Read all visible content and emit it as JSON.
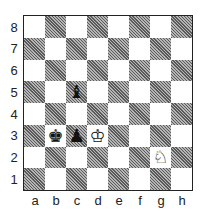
{
  "board": {
    "files": [
      "a",
      "b",
      "c",
      "d",
      "e",
      "f",
      "g",
      "h"
    ],
    "ranks": [
      "8",
      "7",
      "6",
      "5",
      "4",
      "3",
      "2",
      "1"
    ],
    "light_color": "#ffffff",
    "dark_color": "#8a8a8a",
    "pieces": [
      {
        "square": "c5",
        "color": "black",
        "type": "bishop",
        "glyph": "♝"
      },
      {
        "square": "b3",
        "color": "black",
        "type": "king",
        "glyph": "♚"
      },
      {
        "square": "c3",
        "color": "black",
        "type": "pawn",
        "glyph": "♟"
      },
      {
        "square": "d3",
        "color": "white",
        "type": "king",
        "glyph": "♔"
      },
      {
        "square": "g2",
        "color": "white",
        "type": "knight",
        "glyph": "♘"
      }
    ]
  }
}
